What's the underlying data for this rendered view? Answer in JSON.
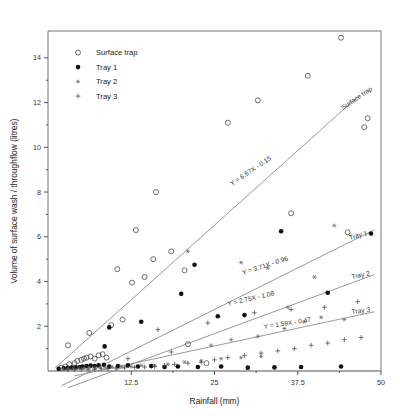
{
  "chart_data": {
    "type": "scatter",
    "title": "",
    "xlabel": "Rainfall (mm)",
    "ylabel": "Volume of surface wash / throughflow (litres)",
    "xlim": [
      0,
      50
    ],
    "ylim": [
      0,
      15.2
    ],
    "xticks": [
      12.5,
      25,
      37.5,
      50
    ],
    "xticklabels": [
      "12.5",
      "25",
      "37.5",
      "50"
    ],
    "yticks": [
      2,
      4,
      6,
      8,
      10,
      12,
      14
    ],
    "yticklabels": [
      "2",
      "4",
      "6",
      "8",
      "10",
      "12",
      "14"
    ],
    "grid": false,
    "legend_position": "top-left",
    "legend": [
      {
        "label": "Surface trap",
        "marker": "open-circle"
      },
      {
        "label": "Tray 1",
        "marker": "filled-circle"
      },
      {
        "label": "Tray 2",
        "marker": "star"
      },
      {
        "label": "Tray 3",
        "marker": "plus"
      }
    ],
    "annotations": [
      {
        "text": "Y = 6.67X - 0.15",
        "series": "Surface trap"
      },
      {
        "text": "Y = 3.71X - 0.96",
        "series": "Tray 1"
      },
      {
        "text": "Y = 2.75X - 1.08",
        "series": "Tray 2"
      },
      {
        "text": "Y = 1.59X - 0.47",
        "series": "Tray 3"
      }
    ],
    "line_labels": [
      {
        "text": "Surface trap"
      },
      {
        "text": "Tray 1"
      },
      {
        "text": "Tray 2"
      },
      {
        "text": "Tray 3"
      }
    ],
    "series": [
      {
        "name": "Surface trap",
        "marker": "open-circle",
        "trendline": {
          "slope": 0.2668,
          "intercept": -0.15,
          "x_start": 1.0,
          "x_end": 46.5
        },
        "points": [
          [
            2.0,
            0.15
          ],
          [
            2.6,
            0.2
          ],
          [
            3.2,
            0.3
          ],
          [
            4.0,
            0.35
          ],
          [
            4.4,
            0.45
          ],
          [
            5.0,
            0.5
          ],
          [
            5.4,
            0.55
          ],
          [
            5.8,
            0.6
          ],
          [
            6.4,
            0.65
          ],
          [
            7.0,
            0.55
          ],
          [
            7.6,
            0.7
          ],
          [
            8.2,
            0.75
          ],
          [
            8.8,
            0.6
          ],
          [
            3.0,
            1.15
          ],
          [
            6.2,
            1.7
          ],
          [
            9.5,
            2.05
          ],
          [
            11.2,
            2.3
          ],
          [
            12.6,
            3.95
          ],
          [
            10.4,
            4.55
          ],
          [
            14.5,
            4.2
          ],
          [
            15.8,
            5.0
          ],
          [
            13.2,
            6.3
          ],
          [
            16.2,
            8.0
          ],
          [
            18.5,
            5.35
          ],
          [
            20.5,
            4.5
          ],
          [
            21.0,
            1.2
          ],
          [
            23.8,
            0.35
          ],
          [
            27.0,
            11.1
          ],
          [
            31.5,
            12.1
          ],
          [
            36.5,
            7.05
          ],
          [
            39.0,
            13.2
          ],
          [
            44.0,
            14.9
          ],
          [
            47.5,
            10.9
          ],
          [
            48.0,
            11.3
          ],
          [
            45.0,
            6.2
          ]
        ]
      },
      {
        "name": "Tray 1",
        "marker": "filled-circle",
        "trendline": {
          "slope": 0.1484,
          "intercept": -0.96,
          "x_start": 2.0,
          "x_end": 49.0
        },
        "points": [
          [
            1.6,
            0.1
          ],
          [
            2.4,
            0.12
          ],
          [
            3.0,
            0.14
          ],
          [
            3.6,
            0.15
          ],
          [
            4.2,
            0.16
          ],
          [
            4.8,
            0.18
          ],
          [
            5.2,
            0.2
          ],
          [
            5.8,
            0.22
          ],
          [
            6.4,
            0.24
          ],
          [
            7.0,
            0.22
          ],
          [
            7.6,
            0.26
          ],
          [
            8.4,
            0.28
          ],
          [
            9.2,
            0.2
          ],
          [
            10.5,
            0.22
          ],
          [
            12.0,
            0.25
          ],
          [
            13.5,
            0.2
          ],
          [
            15.5,
            0.22
          ],
          [
            17.5,
            0.18
          ],
          [
            19.5,
            0.2
          ],
          [
            22.5,
            0.18
          ],
          [
            26.0,
            0.2
          ],
          [
            30.0,
            0.15
          ],
          [
            34.0,
            0.16
          ],
          [
            8.5,
            1.1
          ],
          [
            9.2,
            1.95
          ],
          [
            14.0,
            2.2
          ],
          [
            20.0,
            3.45
          ],
          [
            22.0,
            4.75
          ],
          [
            25.5,
            2.45
          ],
          [
            29.5,
            2.5
          ],
          [
            35.0,
            6.25
          ],
          [
            42.0,
            3.5
          ],
          [
            48.5,
            6.15
          ],
          [
            44.0,
            0.2
          ],
          [
            38.0,
            0.18
          ]
        ]
      },
      {
        "name": "Tray 2",
        "marker": "star",
        "trendline": {
          "slope": 0.11,
          "intercept": -1.08,
          "x_start": 3.0,
          "x_end": 49.0
        },
        "points": [
          [
            2.2,
            0.08
          ],
          [
            3.0,
            0.1
          ],
          [
            3.8,
            0.1
          ],
          [
            4.6,
            0.12
          ],
          [
            5.4,
            0.12
          ],
          [
            6.2,
            0.14
          ],
          [
            7.0,
            0.14
          ],
          [
            7.8,
            0.16
          ],
          [
            8.6,
            0.16
          ],
          [
            9.6,
            0.18
          ],
          [
            11.0,
            0.2
          ],
          [
            12.5,
            0.2
          ],
          [
            14.0,
            0.25
          ],
          [
            16.0,
            0.25
          ],
          [
            18.0,
            0.3
          ],
          [
            20.5,
            0.4
          ],
          [
            23.0,
            0.45
          ],
          [
            26.0,
            0.55
          ],
          [
            29.0,
            0.6
          ],
          [
            32.0,
            0.65
          ],
          [
            24.5,
            1.15
          ],
          [
            27.5,
            1.4
          ],
          [
            31.5,
            1.55
          ],
          [
            35.5,
            1.9
          ],
          [
            38.5,
            2.2
          ],
          [
            41.0,
            2.4
          ],
          [
            36.0,
            2.85
          ],
          [
            40.0,
            4.2
          ],
          [
            44.5,
            2.3
          ],
          [
            21.0,
            5.35
          ],
          [
            29.0,
            4.85
          ],
          [
            33.0,
            4.6
          ],
          [
            43.0,
            6.5
          ]
        ]
      },
      {
        "name": "Tray 3",
        "marker": "plus",
        "trendline": {
          "slope": 0.0636,
          "intercept": -0.47,
          "x_start": 4.0,
          "x_end": 49.0
        },
        "points": [
          [
            3.0,
            0.05
          ],
          [
            4.0,
            0.06
          ],
          [
            5.0,
            0.07
          ],
          [
            6.0,
            0.08
          ],
          [
            7.0,
            0.08
          ],
          [
            8.0,
            0.1
          ],
          [
            9.0,
            0.1
          ],
          [
            10.2,
            0.12
          ],
          [
            11.5,
            0.14
          ],
          [
            13.0,
            0.16
          ],
          [
            14.5,
            0.18
          ],
          [
            16.0,
            0.2
          ],
          [
            17.5,
            0.25
          ],
          [
            19.0,
            0.3
          ],
          [
            21.0,
            0.35
          ],
          [
            23.0,
            0.4
          ],
          [
            25.0,
            0.5
          ],
          [
            27.0,
            0.6
          ],
          [
            29.5,
            0.7
          ],
          [
            32.0,
            0.8
          ],
          [
            34.5,
            0.9
          ],
          [
            37.0,
            1.0
          ],
          [
            39.5,
            1.15
          ],
          [
            42.0,
            1.25
          ],
          [
            44.5,
            1.4
          ],
          [
            47.0,
            1.5
          ],
          [
            16.5,
            1.85
          ],
          [
            24.0,
            2.15
          ],
          [
            31.0,
            2.6
          ],
          [
            36.5,
            2.75
          ],
          [
            41.5,
            2.85
          ],
          [
            46.5,
            3.1
          ],
          [
            12.0,
            0.55
          ],
          [
            18.5,
            0.85
          ]
        ]
      }
    ]
  }
}
